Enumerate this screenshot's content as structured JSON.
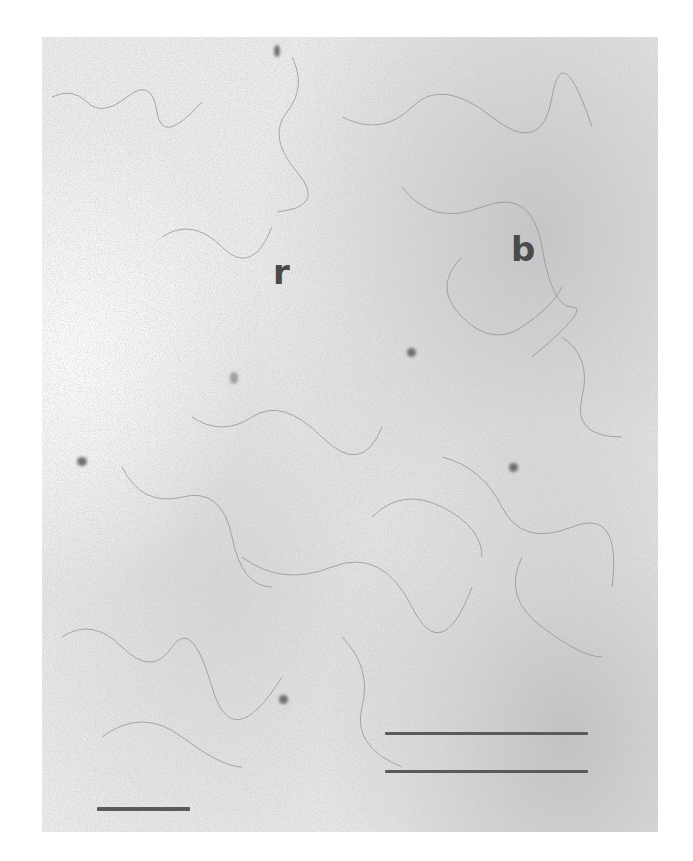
{
  "figure": {
    "type": "electron micrograph",
    "background_color": "#ececec",
    "labels": [
      {
        "text": "r",
        "x": 273,
        "y": 255
      },
      {
        "text": "b",
        "x": 511,
        "y": 232
      }
    ],
    "scale_bars": [
      {
        "name": "left-scale-bar",
        "x1": 97,
        "x2": 190,
        "y": 809
      },
      {
        "name": "right-scale-bar-top",
        "x1": 385,
        "x2": 588,
        "y": 734
      },
      {
        "name": "right-scale-bar-bottom",
        "x1": 385,
        "x2": 588,
        "y": 772
      }
    ],
    "dark_spots": [
      {
        "x": 412,
        "y": 353
      },
      {
        "x": 513,
        "y": 467
      },
      {
        "x": 82,
        "y": 462
      },
      {
        "x": 283,
        "y": 700
      },
      {
        "x": 277,
        "y": 47
      },
      {
        "x": 237,
        "y": 378
      }
    ]
  }
}
